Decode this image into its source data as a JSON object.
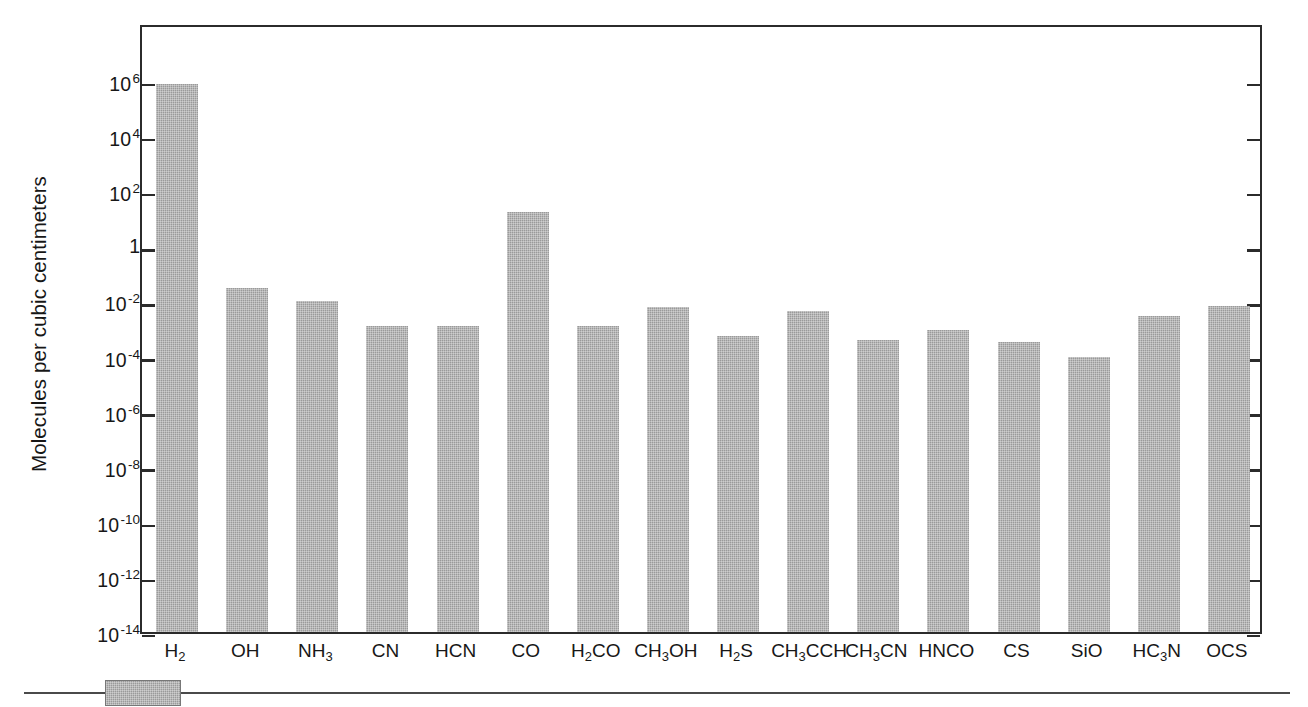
{
  "chart_data": {
    "type": "bar",
    "title": "",
    "subtitle": "",
    "xlabel": "",
    "ylabel": "Molecules per cubic centimeters",
    "yscale": "log",
    "ylim": [
      1e-14,
      10000000.0
    ],
    "grid": false,
    "legend": "none",
    "bar_color": "#9a9a9a",
    "axis_color": "#2b2b2b",
    "categories": [
      "H2",
      "OH",
      "NH3",
      "CN",
      "HCN",
      "CO",
      "H2CO",
      "CH3OH",
      "H2S",
      "CH3CCH",
      "CH3CN",
      "HNCO",
      "CS",
      "SiO",
      "HC3N",
      "OCS"
    ],
    "category_labels_html": [
      "H<sub>2</sub>",
      "OH",
      "NH<sub>3</sub>",
      "CN",
      "HCN",
      "CO",
      "H<sub>2</sub>CO",
      "CH<sub>3</sub>OH",
      "H<sub>2</sub>S",
      "CH<sub>3</sub>CCH",
      "CH<sub>3</sub>CN",
      "HNCO",
      "CS",
      "SiO",
      "HC<sub>3</sub>N",
      "OCS"
    ],
    "values": [
      800000.0,
      0.03,
      0.01,
      0.0013,
      0.0013,
      18.0,
      0.0013,
      0.006,
      0.00055,
      0.0045,
      0.0004,
      0.0009,
      0.00032,
      0.0001,
      0.003,
      0.007
    ],
    "value_exponents": [
      5.9,
      -1.52,
      -2.0,
      -2.89,
      -2.89,
      1.26,
      -2.89,
      -2.22,
      -3.26,
      -2.35,
      -3.4,
      -3.05,
      -3.49,
      -4.0,
      -2.52,
      -2.15
    ],
    "ytick_labels": [
      "10⁶",
      "10⁴",
      "10²",
      "1",
      "10⁻²",
      "10⁻⁴",
      "10⁻⁶",
      "10⁻⁸",
      "10⁻¹⁰",
      "10⁻¹²",
      "10⁻¹⁴"
    ],
    "yticks": [
      {
        "mantissa": "10",
        "exponent": "6",
        "value": 1000000.0
      },
      {
        "mantissa": "10",
        "exponent": "4",
        "value": 10000.0
      },
      {
        "mantissa": "10",
        "exponent": "2",
        "value": 100.0
      },
      {
        "mantissa": "1",
        "exponent": "",
        "value": 1
      },
      {
        "mantissa": "10",
        "exponent": "-2",
        "value": 0.01
      },
      {
        "mantissa": "10",
        "exponent": "-4",
        "value": 0.0001
      },
      {
        "mantissa": "10",
        "exponent": "-6",
        "value": 1e-06
      },
      {
        "mantissa": "10",
        "exponent": "-8",
        "value": 1e-08
      },
      {
        "mantissa": "10",
        "exponent": "-10",
        "value": 1e-10
      },
      {
        "mantissa": "10",
        "exponent": "-12",
        "value": 1e-12
      },
      {
        "mantissa": "10",
        "exponent": "-14",
        "value": 1e-14
      }
    ]
  }
}
